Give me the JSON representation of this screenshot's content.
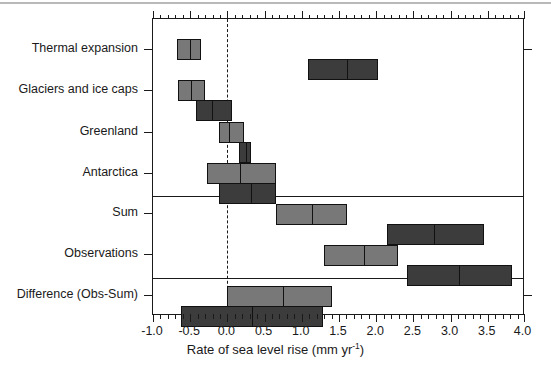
{
  "chart_data": {
    "type": "bar",
    "title": "",
    "xlabel": "Rate of sea level rise (mm yr",
    "xlabel_sup": "-1",
    "xlabel_close": ")",
    "ylabel": "",
    "xlim": [
      -1.0,
      4.0
    ],
    "xticks": [
      -1.0,
      -0.5,
      0.0,
      0.5,
      1.0,
      1.5,
      2.0,
      2.5,
      3.0,
      3.5,
      4.0
    ],
    "xtick_labels": [
      "-1.0",
      "-0.5",
      "0.0",
      "0.5",
      "1.0",
      "1.5",
      "2.0",
      "2.5",
      "3.0",
      "3.5",
      "4.0"
    ],
    "xminor_step": 0.1,
    "grid": false,
    "legend": "none",
    "zero_reference_line": 0.0,
    "orientation": "horizontal",
    "categories": [
      "Thermal expansion",
      "Glaciers and ice caps",
      "Greenland",
      "Antarctica",
      "Sum",
      "Observations",
      "Difference (Obs-Sum)"
    ],
    "series": [
      {
        "name": "light",
        "color": "#787878",
        "values": [
          {
            "category": "Thermal expansion",
            "low": 0.32,
            "mid": 0.48,
            "high": 0.65
          },
          {
            "category": "Glaciers and ice caps",
            "low": 0.33,
            "mid": 0.5,
            "high": 0.7
          },
          {
            "category": "Greenland",
            "low": -0.11,
            "mid": 0.01,
            "high": 0.22
          },
          {
            "category": "Antarctica",
            "low": -0.27,
            "mid": 0.16,
            "high": 0.66
          },
          {
            "category": "Sum",
            "low": 0.65,
            "mid": 1.12,
            "high": 1.61
          },
          {
            "category": "Observations",
            "low": 1.3,
            "mid": 1.83,
            "high": 2.3
          },
          {
            "category": "Difference (Obs-Sum)",
            "low": 0.0,
            "mid": 0.73,
            "high": 1.4
          }
        ]
      },
      {
        "name": "dark",
        "color": "#3c3c3c",
        "values": [
          {
            "category": "Thermal expansion",
            "low": 1.08,
            "mid": 1.59,
            "high": 2.02
          },
          {
            "category": "Glaciers and ice caps",
            "low": 0.58,
            "mid": 0.78,
            "high": 1.06
          },
          {
            "category": "Greenland",
            "low": 0.16,
            "mid": 0.24,
            "high": 0.32
          },
          {
            "category": "Antarctica",
            "low": -0.11,
            "mid": 0.3,
            "high": 0.66
          },
          {
            "category": "Sum",
            "low": 2.15,
            "mid": 2.77,
            "high": 3.45
          },
          {
            "category": "Observations",
            "low": 2.41,
            "mid": 3.1,
            "high": 3.83
          },
          {
            "category": "Difference (Obs-Sum)",
            "low": -0.63,
            "mid": 0.32,
            "high": 1.29
          }
        ]
      }
    ],
    "group_separators_after": [
      "Antarctica",
      "Observations"
    ]
  },
  "axis": {
    "x_title_main": "Rate of sea level rise (mm yr",
    "x_title_sup": "-1",
    "x_title_end": ")"
  }
}
